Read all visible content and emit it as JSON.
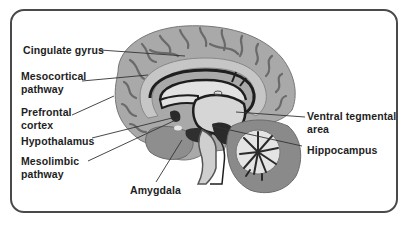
{
  "diagram": {
    "type": "anatomical-brain-sagittal-section",
    "labels_left": [
      {
        "id": "cingulate-gyrus",
        "text": "Cingulate gyrus"
      },
      {
        "id": "mesocortical-pathway",
        "text": "Mesocortical pathway"
      },
      {
        "id": "prefrontal-cortex",
        "text": "Prefrontal cortex"
      },
      {
        "id": "hypothalamus",
        "text": "Hypothalamus"
      },
      {
        "id": "mesolimbic-pathway",
        "text": "Mesolimbic pathway"
      }
    ],
    "labels_bottom": [
      {
        "id": "amygdala",
        "text": "Amygdala"
      }
    ],
    "labels_right": [
      {
        "id": "ventral-tegmental-area",
        "text": "Ventral tegmental area"
      },
      {
        "id": "hippocampus",
        "text": "Hippocampus"
      }
    ],
    "colors": {
      "border": "#4a4a4a",
      "cortex": "#a9a9a9",
      "sulci": "#6a6a6a",
      "inner_light": "#d6d6d6",
      "pathway_dark": "#1e1e1e",
      "cerebellum": "#8a8a8a",
      "label_text": "#1e1e1e"
    }
  }
}
